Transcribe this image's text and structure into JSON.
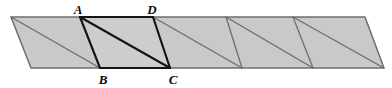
{
  "figure": {
    "canvas": {
      "width": 392,
      "height": 88
    },
    "colors": {
      "background": "#ffffff",
      "fill_light": "#c9c9c9",
      "fill_highlight": "#c4c4c4",
      "stroke_thin": "#6e6e6e",
      "stroke_bold": "#141414",
      "label_color": "#0a0a0a"
    },
    "strip": {
      "top_left": {
        "x": 11,
        "y": 17
      },
      "top_right": {
        "x": 365,
        "y": 17
      },
      "bottom_right": {
        "x": 384,
        "y": 68
      },
      "bottom_left": {
        "x": 31,
        "y": 68
      },
      "slant_dx": 20,
      "cell_count": 5,
      "top_divider_x": [
        80,
        153,
        226,
        293
      ],
      "bottom_divider_x": [
        100,
        170,
        242,
        313
      ]
    },
    "highlight_cell": {
      "index": 2,
      "points": [
        {
          "x": 80,
          "y": 17
        },
        {
          "x": 153,
          "y": 17
        },
        {
          "x": 170,
          "y": 68
        },
        {
          "x": 100,
          "y": 68
        }
      ],
      "diagonal": {
        "from": {
          "x": 80,
          "y": 17
        },
        "to": {
          "x": 170,
          "y": 68
        }
      }
    },
    "labels": [
      {
        "id": "A",
        "text": "A",
        "x": 78,
        "y": 9
      },
      {
        "id": "D",
        "text": "D",
        "x": 152,
        "y": 9
      },
      {
        "id": "B",
        "text": "B",
        "x": 103,
        "y": 79
      },
      {
        "id": "C",
        "text": "C",
        "x": 173,
        "y": 79
      }
    ],
    "diagonals": [
      {
        "from": {
          "x": 11,
          "y": 17
        },
        "to": {
          "x": 100,
          "y": 68
        }
      },
      {
        "from": {
          "x": 80,
          "y": 17
        },
        "to": {
          "x": 170,
          "y": 68
        }
      },
      {
        "from": {
          "x": 153,
          "y": 17
        },
        "to": {
          "x": 242,
          "y": 68
        }
      },
      {
        "from": {
          "x": 226,
          "y": 17
        },
        "to": {
          "x": 313,
          "y": 68
        }
      },
      {
        "from": {
          "x": 293,
          "y": 17
        },
        "to": {
          "x": 384,
          "y": 68
        }
      }
    ]
  }
}
